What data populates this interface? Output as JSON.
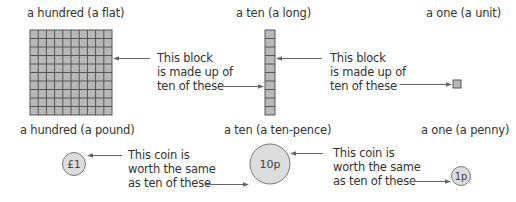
{
  "blocks": {
    "hundred": {
      "label": "a hundred (a flat)"
    },
    "ten": {
      "label": "a ten (a long)"
    },
    "one": {
      "label": "a one (a unit)"
    },
    "explanation_1": [
      "This block",
      "is made up of",
      "ten of these"
    ],
    "explanation_2": [
      "This block",
      "is made up of",
      "ten of these"
    ]
  },
  "coins": {
    "pound": {
      "label": "a hundred (a pound)",
      "face": "£1"
    },
    "tenpence": {
      "label": "a ten (a ten-pence)",
      "face": "10p"
    },
    "penny": {
      "label": "a one (a penny)",
      "face": "1p"
    },
    "explanation_1": [
      "This coin is",
      "worth the same",
      "as ten of these"
    ],
    "explanation_2": [
      "This coin is",
      "worth the same",
      "as ten of these"
    ]
  },
  "colors": {
    "block_fill": "#b8b8b8",
    "grid_line": "#555555",
    "coin_fill": "#dcdcdc",
    "coin_stroke": "#777777",
    "arrow": "#666666",
    "text": "#333333"
  },
  "grid": {
    "rows": 10,
    "cols": 10
  }
}
